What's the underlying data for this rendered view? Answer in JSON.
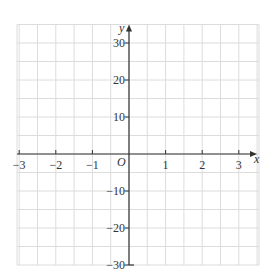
{
  "chart_data": {
    "type": "line",
    "title": "",
    "xlabel": "x",
    "ylabel": "y",
    "origin_label": "O",
    "xlim": [
      -3,
      3
    ],
    "ylim": [
      -30,
      35
    ],
    "x_ticks": [
      -3,
      -2,
      -1,
      1,
      2,
      3
    ],
    "x_tick_labels": [
      "−3",
      "−2",
      "−1",
      "1",
      "2",
      "3"
    ],
    "y_ticks": [
      30,
      20,
      10,
      -10,
      -20,
      -30
    ],
    "y_tick_labels": [
      "30",
      "20",
      "10",
      "−10",
      "−20",
      "−30"
    ],
    "grid": true,
    "grid_x_step": 0.5,
    "grid_y_step": 5,
    "series": []
  },
  "colors": {
    "grid": "#dcdcdc",
    "axis": "#333333",
    "background": "#ffffff"
  }
}
